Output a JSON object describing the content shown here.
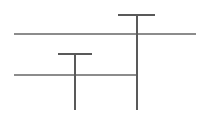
{
  "canvas": {
    "width": 205,
    "height": 115,
    "background_color": "#ffffff",
    "title": "Line Diagram"
  },
  "palette": {
    "pole_color": "#595959",
    "wire_color": "#8c8c8c",
    "crossarm_color": "#595959",
    "background": "#ffffff"
  },
  "figure": {
    "strokes": [
      {
        "name": "top-crossarm",
        "kind": "horizontal",
        "x1": 118,
        "y1": 15,
        "x2": 155,
        "y2": 15,
        "width": 1.6,
        "color": "#595959"
      },
      {
        "name": "upper-long-line",
        "kind": "horizontal",
        "x1": 14,
        "y1": 34,
        "x2": 196,
        "y2": 34,
        "width": 1.2,
        "color": "#8c8c8c"
      },
      {
        "name": "middle-crossarm",
        "kind": "horizontal",
        "x1": 58,
        "y1": 54,
        "x2": 92,
        "y2": 54,
        "width": 1.6,
        "color": "#595959"
      },
      {
        "name": "lower-long-line",
        "kind": "horizontal",
        "x1": 14,
        "y1": 75,
        "x2": 138,
        "y2": 75,
        "width": 1.2,
        "color": "#8c8c8c"
      },
      {
        "name": "right-pole",
        "kind": "vertical",
        "x1": 137,
        "y1": 15,
        "x2": 137,
        "y2": 110,
        "width": 1.3,
        "color": "#595959"
      },
      {
        "name": "left-pole",
        "kind": "vertical",
        "x1": 75,
        "y1": 54,
        "x2": 75,
        "y2": 110,
        "width": 1.3,
        "color": "#595959"
      }
    ],
    "intersections": [
      {
        "name": "right-pole-upper-line",
        "x": 137,
        "y": 34
      },
      {
        "name": "right-pole-lower-line",
        "x": 137,
        "y": 75
      },
      {
        "name": "left-pole-lower-line",
        "x": 75,
        "y": 75
      }
    ]
  }
}
